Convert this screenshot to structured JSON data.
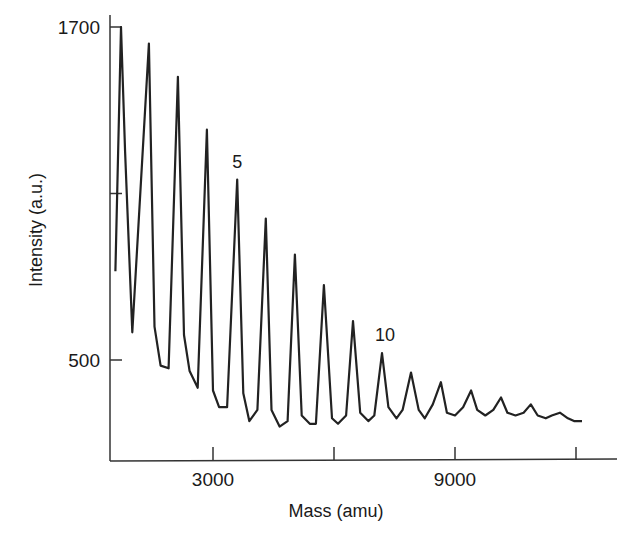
{
  "chart_data": {
    "type": "line",
    "title": "",
    "xlabel": "Mass (amu)",
    "ylabel": "Intensity (a.u.)",
    "xlim": [
      430,
      15000
    ],
    "ylim": [
      200,
      1700
    ],
    "grid": false,
    "legend": null,
    "x_ticks": [
      {
        "value": 3000,
        "label": "3000"
      },
      {
        "value": 6000,
        "label": ""
      },
      {
        "value": 9000,
        "label": "9000"
      },
      {
        "value": 12000,
        "label": ""
      }
    ],
    "y_ticks": [
      {
        "value": 1700,
        "label": "1700"
      },
      {
        "value": 1100,
        "label": ""
      },
      {
        "value": 500,
        "label": "500"
      }
    ],
    "annotations": [
      {
        "text": "5",
        "peak_index": 5
      },
      {
        "text": "10",
        "peak_index": 10
      }
    ],
    "peaks": [
      {
        "n": 1,
        "mass": 720,
        "intensity": 1700
      },
      {
        "n": 2,
        "mass": 1410,
        "intensity": 1640
      },
      {
        "n": 3,
        "mass": 2130,
        "intensity": 1520
      },
      {
        "n": 4,
        "mass": 2850,
        "intensity": 1330
      },
      {
        "n": 5,
        "mass": 3600,
        "intensity": 1150
      },
      {
        "n": 6,
        "mass": 4310,
        "intensity": 1010
      },
      {
        "n": 7,
        "mass": 5030,
        "intensity": 880
      },
      {
        "n": 8,
        "mass": 5750,
        "intensity": 770
      },
      {
        "n": 9,
        "mass": 6470,
        "intensity": 640
      },
      {
        "n": 10,
        "mass": 7190,
        "intensity": 525
      },
      {
        "n": 11,
        "mass": 7910,
        "intensity": 455
      },
      {
        "n": 12,
        "mass": 8650,
        "intensity": 420
      },
      {
        "n": 13,
        "mass": 9400,
        "intensity": 390
      },
      {
        "n": 14,
        "mass": 10140,
        "intensity": 365
      },
      {
        "n": 15,
        "mass": 10880,
        "intensity": 340
      },
      {
        "n": 16,
        "mass": 11600,
        "intensity": 310
      }
    ],
    "series": [
      {
        "name": "spectrum",
        "x": [
          580,
          720,
          820,
          1000,
          1410,
          1550,
          1700,
          1900,
          2130,
          2280,
          2420,
          2620,
          2850,
          3000,
          3150,
          3350,
          3600,
          3750,
          3900,
          4100,
          4310,
          4450,
          4650,
          4850,
          5030,
          5200,
          5400,
          5550,
          5750,
          5950,
          6100,
          6300,
          6470,
          6650,
          6850,
          7000,
          7190,
          7350,
          7550,
          7700,
          7910,
          8100,
          8250,
          8450,
          8650,
          8800,
          9000,
          9200,
          9400,
          9550,
          9750,
          9950,
          10140,
          10300,
          10500,
          10700,
          10880,
          11050,
          11250,
          11400,
          11600,
          11800,
          11950,
          12150
        ],
        "y": [
          820,
          1700,
          1250,
          600,
          1640,
          620,
          480,
          470,
          1520,
          590,
          460,
          400,
          1330,
          390,
          330,
          330,
          1150,
          380,
          280,
          320,
          1010,
          320,
          260,
          280,
          880,
          300,
          270,
          270,
          770,
          290,
          270,
          300,
          640,
          310,
          280,
          300,
          525,
          330,
          290,
          320,
          455,
          320,
          290,
          340,
          420,
          310,
          300,
          330,
          390,
          320,
          300,
          320,
          365,
          310,
          300,
          310,
          340,
          300,
          290,
          300,
          310,
          290,
          280,
          280
        ]
      }
    ]
  }
}
